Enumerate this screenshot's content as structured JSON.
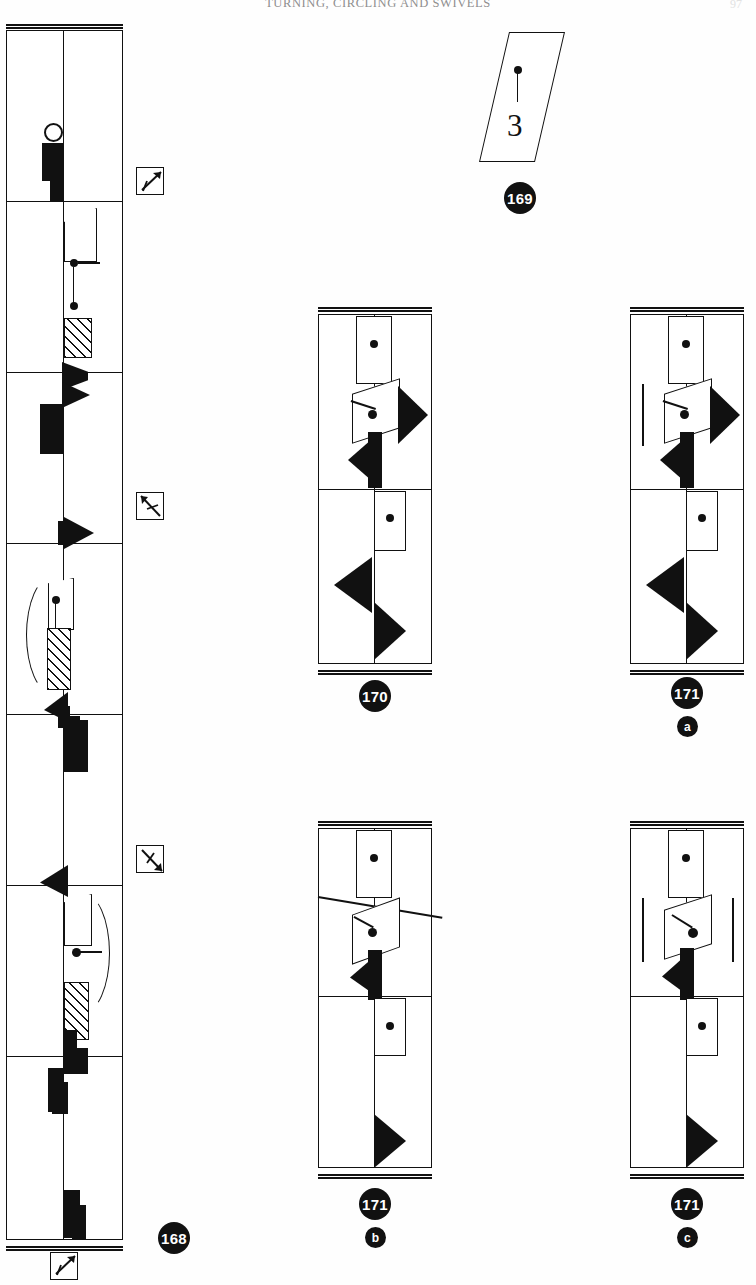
{
  "page": {
    "running_head": "TURNING, CIRCLING AND SWIVELS",
    "folio": "97"
  },
  "figures": [
    {
      "id": "fig-168",
      "label": "168",
      "sub_label": "",
      "caption_number": "168",
      "type": "labanotation-staff",
      "description": "Tall single notation staff divided into seven measures, read bottom to top"
    },
    {
      "id": "fig-169",
      "label": "169",
      "sub_label": "",
      "caption_number": "169",
      "type": "pin-plate",
      "plate_numeral": "3",
      "description": "Skewed rectangular plate containing an upward pin and the numeral 3"
    },
    {
      "id": "fig-170",
      "label": "170",
      "sub_label": "",
      "caption_number": "170",
      "type": "labanotation-staff",
      "description": "Two-measure staff with rotation parallelogram and black direction signs"
    },
    {
      "id": "fig-171a",
      "label": "171",
      "sub_label": "a",
      "caption_number": "171",
      "type": "labanotation-staff",
      "description": "Two-measure staff with single vertical rule at left of the rotation sign"
    },
    {
      "id": "fig-171b",
      "label": "171",
      "sub_label": "b",
      "caption_number": "171",
      "type": "labanotation-staff",
      "description": "Two-measure staff with long diagonal rule crossing the whole staff"
    },
    {
      "id": "fig-171c",
      "label": "171",
      "sub_label": "c",
      "caption_number": "171",
      "type": "labanotation-staff",
      "description": "Two-measure staff with vertical rules on both sides of the rotation sign"
    }
  ],
  "direction_keys": [
    {
      "id": "key-1",
      "name": "direction-key-up-right",
      "arrow_angle_deg": -45,
      "description": "Boxed arrow pointing to upper right"
    },
    {
      "id": "key-2",
      "name": "direction-key-down-right",
      "arrow_angle_deg": 45,
      "description": "Boxed arrow pointing to lower right"
    },
    {
      "id": "key-3",
      "name": "direction-key-down-right-low",
      "arrow_angle_deg": 45,
      "description": "Boxed arrow pointing to lower right"
    },
    {
      "id": "key-4",
      "name": "direction-key-up-right-bottom",
      "arrow_angle_deg": -45,
      "description": "Boxed arrow pointing to upper right"
    }
  ],
  "colors": {
    "ink": "#111111",
    "paper": "#fefefe",
    "badge_bg": "#111111",
    "badge_fg": "#ffffff",
    "runhead": "#8e8e8e"
  }
}
